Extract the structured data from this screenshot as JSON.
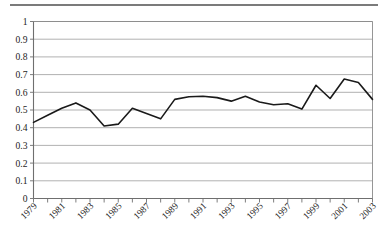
{
  "figure": {
    "top_rule": "horizontal-rule",
    "background_color": "#ffffff",
    "line_color": "#1a1a1a",
    "grid_color": "#a8a8a8",
    "axis_color": "#6f6f6f"
  },
  "chart_data": {
    "type": "line",
    "title": "",
    "subtitle": "",
    "xlabel": "",
    "ylabel": "",
    "xlim": [
      1979,
      2003
    ],
    "ylim": [
      0,
      1
    ],
    "grid": true,
    "grid_axis": "y",
    "legend": false,
    "legend_position": "none",
    "x": [
      1979,
      1980,
      1981,
      1982,
      1983,
      1984,
      1985,
      1986,
      1987,
      1988,
      1989,
      1990,
      1991,
      1992,
      1993,
      1994,
      1995,
      1996,
      1997,
      1998,
      1999,
      2000,
      2001,
      2002,
      2003
    ],
    "values": [
      0.43,
      0.47,
      0.51,
      0.54,
      0.5,
      0.41,
      0.42,
      0.51,
      0.48,
      0.45,
      0.56,
      0.575,
      0.578,
      0.57,
      0.55,
      0.578,
      0.545,
      0.53,
      0.535,
      0.505,
      0.64,
      0.565,
      0.675,
      0.655,
      0.56
    ],
    "ytick_values": [
      0,
      0.1,
      0.2,
      0.3,
      0.4,
      0.5,
      0.6,
      0.7,
      0.8,
      0.9,
      1
    ],
    "ytick_labels": [
      "0",
      "0.1",
      "0.2",
      "0.3",
      "0.4",
      "0.5",
      "0.6",
      "0.7",
      "0.8",
      "0.9",
      "1"
    ],
    "xtick_values": [
      1979,
      1981,
      1983,
      1985,
      1987,
      1989,
      1991,
      1993,
      1995,
      1997,
      1999,
      2001,
      2003
    ],
    "xtick_labels": [
      "1979",
      "1981",
      "1983",
      "1985",
      "1987",
      "1989",
      "1991",
      "1993",
      "1995",
      "1997",
      "1999",
      "2001",
      "2003"
    ],
    "xtick_all_years": [
      1979,
      1980,
      1981,
      1982,
      1983,
      1984,
      1985,
      1986,
      1987,
      1988,
      1989,
      1990,
      1991,
      1992,
      1993,
      1994,
      1995,
      1996,
      1997,
      1998,
      1999,
      2000,
      2001,
      2002,
      2003
    ]
  }
}
